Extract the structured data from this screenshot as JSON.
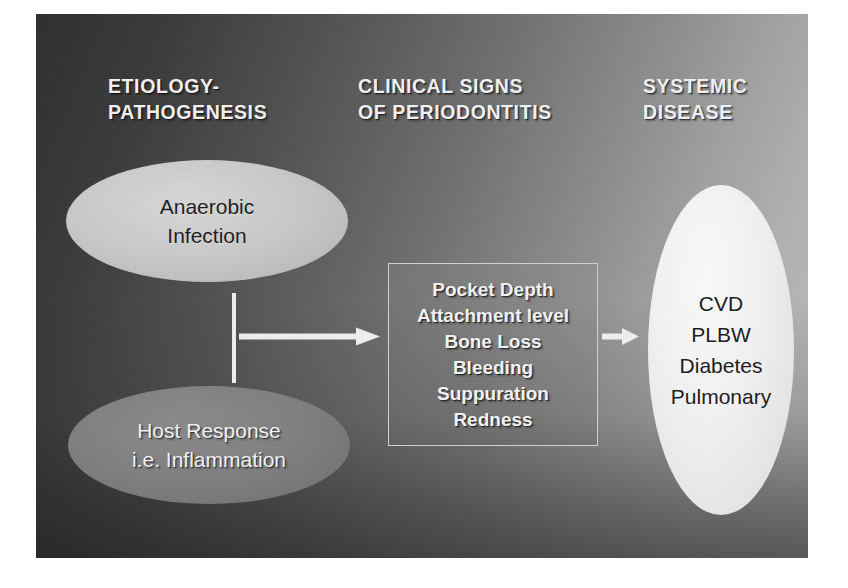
{
  "diagram": {
    "type": "flow-diagram",
    "background": {
      "gradient_from": "#2f2f2f",
      "gradient_to": "#bdbdbd",
      "direction": "diagonal top-right light to bottom-left dark"
    },
    "headings": [
      {
        "id": "etiology",
        "label": "ETIOLOGY-\nPATHOGENESIS",
        "color": "#f2f2f2"
      },
      {
        "id": "clinical",
        "label": "CLINICAL SIGNS\nOF PERIODONTITIS",
        "color": "#f2f2f2"
      },
      {
        "id": "systemic",
        "label": "SYSTEMIC\nDISEASE",
        "color": "#f2f2f2"
      }
    ],
    "nodes": [
      {
        "id": "anaerobic-infection",
        "shape": "ellipse",
        "label": "Anaerobic\nInfection",
        "fill": "#c8c8c8",
        "text_color": "#1d1d1d"
      },
      {
        "id": "host-response",
        "shape": "ellipse",
        "label": "Host Response\ni.e. Inflammation",
        "fill": "#7a7a7a",
        "text_color": "#f4f4f4"
      },
      {
        "id": "clinical-signs",
        "shape": "rectangle",
        "label": "Pocket Depth\nAttachment level\nBone Loss\nBleeding\nSuppuration\nRedness",
        "items": [
          "Pocket Depth",
          "Attachment level",
          "Bone Loss",
          "Bleeding",
          "Suppuration",
          "Redness"
        ],
        "fill": "transparent",
        "border": "#d2d2d2",
        "text_color": "#f4f4f4"
      },
      {
        "id": "systemic-disease",
        "shape": "ellipse",
        "label": "CVD\nPLBW\nDiabetes\nPulmonary",
        "items": [
          "CVD",
          "PLBW",
          "Diabetes",
          "Pulmonary"
        ],
        "fill": "#f2f2f2",
        "text_color": "#1b1b1b"
      }
    ],
    "connectors": [
      {
        "id": "bracket-bar",
        "type": "vertical-bar",
        "color": "#f0f0f0",
        "joins": [
          "anaerobic-infection",
          "host-response"
        ]
      },
      {
        "id": "arrow-to-signs",
        "type": "arrow",
        "color": "#f2f2f2",
        "from": "bracket-bar",
        "to": "clinical-signs"
      },
      {
        "id": "arrow-to-systemic",
        "type": "arrow",
        "color": "#f2f2f2",
        "from": "clinical-signs",
        "to": "systemic-disease"
      }
    ]
  }
}
